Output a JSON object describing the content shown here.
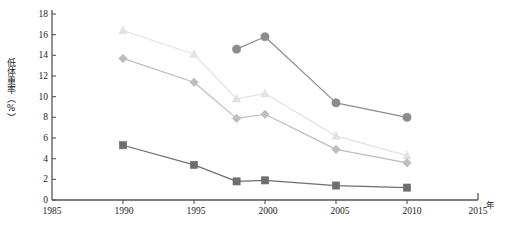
{
  "chart_data": {
    "type": "line",
    "title": "",
    "xlabel": "年",
    "ylabel": "低体重率（%）",
    "xlim": [
      1985,
      2015
    ],
    "ylim": [
      0,
      18
    ],
    "x_ticks": [
      1985,
      1990,
      1995,
      2000,
      2005,
      2010,
      2015
    ],
    "y_ticks": [
      0,
      2,
      4,
      6,
      8,
      10,
      12,
      14,
      16,
      18
    ],
    "grid": false,
    "legend": "none",
    "series": [
      {
        "name": "series-triangle",
        "marker": "triangle",
        "color": "#e2e2e2",
        "x": [
          1990,
          1995,
          1998,
          2000,
          2005,
          2010
        ],
        "values": [
          16.4,
          14.1,
          9.8,
          10.3,
          6.2,
          4.3
        ]
      },
      {
        "name": "series-diamond",
        "marker": "diamond",
        "color": "#bdbdbd",
        "x": [
          1990,
          1995,
          1998,
          2000,
          2005,
          2010
        ],
        "values": [
          13.7,
          11.4,
          7.9,
          8.3,
          4.9,
          3.6
        ]
      },
      {
        "name": "series-circle",
        "marker": "circle",
        "color": "#8c8c8c",
        "x": [
          1998,
          2000,
          2005,
          2010
        ],
        "values": [
          14.6,
          15.8,
          9.4,
          8.0
        ]
      },
      {
        "name": "series-square",
        "marker": "square",
        "color": "#6e6e6e",
        "x": [
          1990,
          1995,
          1998,
          2000,
          2005,
          2010
        ],
        "values": [
          5.3,
          3.4,
          1.8,
          1.9,
          1.4,
          1.2
        ]
      }
    ]
  },
  "axis": {
    "y_tick_labels": [
      "18",
      "16",
      "14",
      "12",
      "10",
      "8",
      "6",
      "4",
      "2",
      "0"
    ],
    "x_tick_labels": [
      "1985",
      "1990",
      "1995",
      "2000",
      "2005",
      "2010",
      "2015"
    ],
    "y_axis_title": "低体重率（%）",
    "x_axis_unit": "年"
  },
  "colors": {
    "axis": "#555555",
    "text": "#1a1a1a",
    "background": "#ffffff"
  },
  "caption": {
    "sliver_text": ""
  }
}
